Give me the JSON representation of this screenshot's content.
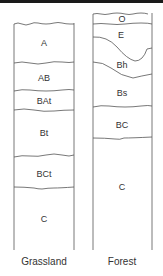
{
  "diagram": {
    "type": "soil-profile-comparison",
    "profiles": [
      {
        "name": "Grassland",
        "horizons": [
          {
            "label": "A"
          },
          {
            "label": "AB"
          },
          {
            "label": "BAt"
          },
          {
            "label": "Bt"
          },
          {
            "label": "BCt"
          },
          {
            "label": "C"
          }
        ]
      },
      {
        "name": "Forest",
        "horizons": [
          {
            "label": "O"
          },
          {
            "label": "E"
          },
          {
            "label": "Bh"
          },
          {
            "label": "Bs"
          },
          {
            "label": "BC"
          },
          {
            "label": "C"
          }
        ]
      }
    ],
    "colors": {
      "line": "#555555",
      "text": "#333333",
      "background": "#ffffff",
      "top_rule": "#1a1a1a"
    }
  }
}
